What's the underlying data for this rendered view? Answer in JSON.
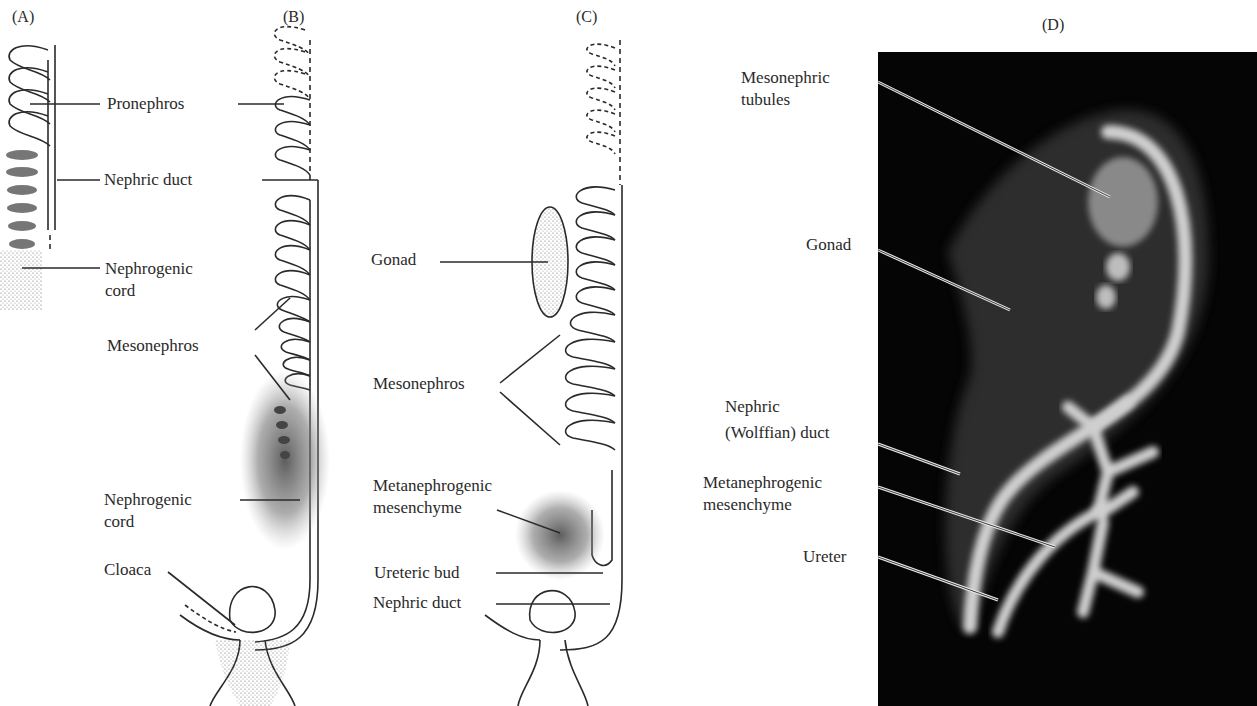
{
  "figure": {
    "panels": [
      {
        "id": "A",
        "label": "(A)"
      },
      {
        "id": "B",
        "label": "(B)"
      },
      {
        "id": "C",
        "label": "(C)"
      },
      {
        "id": "D",
        "label": "(D)"
      }
    ],
    "labels_AB": {
      "pronephros": "Pronephros",
      "nephric_duct": "Nephric duct",
      "nephrogenic_cord_A_1": "Nephrogenic",
      "nephrogenic_cord_A_2": "cord",
      "mesonephros": "Mesonephros",
      "nephrogenic_cord_B_1": "Nephrogenic",
      "nephrogenic_cord_B_2": "cord",
      "cloaca": "Cloaca"
    },
    "labels_C": {
      "gonad": "Gonad",
      "mesonephros": "Mesonephros",
      "metanephrogenic_1": "Metanephrogenic",
      "metanephrogenic_2": "mesenchyme",
      "ureteric_bud": "Ureteric bud",
      "nephric_duct": "Nephric duct"
    },
    "labels_D": {
      "mesonephric_tubules_1": "Mesonephric",
      "mesonephric_tubules_2": "tubules",
      "gonad": "Gonad",
      "nephric_1": "Nephric",
      "nephric_2": "(Wolffian) duct",
      "metanephrogenic_1": "Metanephrogenic",
      "metanephrogenic_2": "mesenchyme",
      "ureter": "Ureter"
    },
    "colors": {
      "ink": "#2a2a2a",
      "photo_bg": "#050505",
      "tissue": "#d8d8d8"
    }
  }
}
